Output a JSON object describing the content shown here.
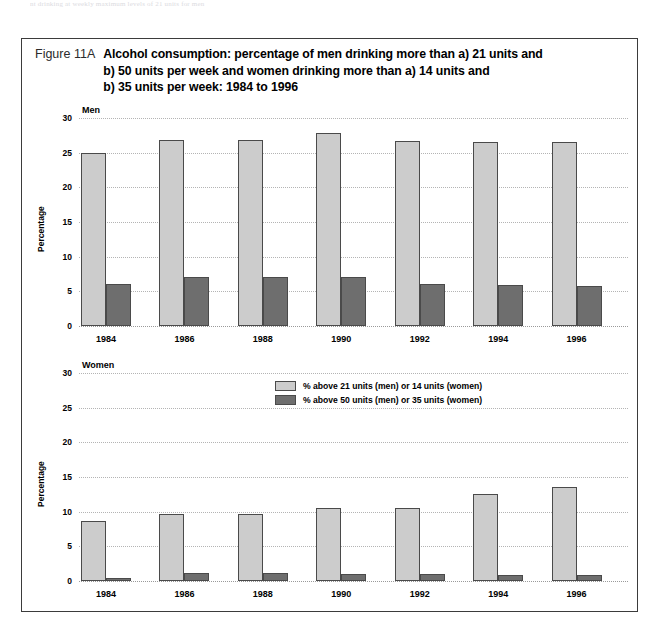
{
  "top_strip": {
    "text": "nt drinking at weekly maximum levels of 21 units for men"
  },
  "figure": {
    "number": "Figure 11A",
    "title_lines": [
      "Alcohol consumption: percentage of men drinking more than a) 21 units and",
      "b) 50 units per week and women drinking more than a) 14 units and",
      "b) 35 units per week: 1984 to 1996"
    ]
  },
  "colors": {
    "light_bar": "#cccccc",
    "dark_bar": "#6e6e6e",
    "bar_border": "#4a4a4a",
    "gridline": "#b4b4b4",
    "frame": "#3b3b3b"
  },
  "legend": {
    "items": [
      {
        "label": "% above 21 units (men) or 14 units (women)",
        "color": "#cccccc",
        "key": "legend-swatch-light"
      },
      {
        "label": "% above 50 units (men) or 35 units (women)",
        "color": "#6e6e6e",
        "key": "legend-swatch-dark"
      }
    ]
  },
  "chart_data": [
    {
      "type": "bar",
      "panel": "Men",
      "title": "Men",
      "xlabel": "",
      "ylabel": "Percentage",
      "ylim": [
        0,
        30
      ],
      "yticks": [
        0,
        5,
        10,
        15,
        20,
        25,
        30
      ],
      "ytick_labels": [
        "0",
        "5",
        "10",
        "15",
        "20",
        "25",
        "30"
      ],
      "grid": true,
      "categories": [
        "1984",
        "1986",
        "1988",
        "1990",
        "1992",
        "1994",
        "1996"
      ],
      "series": [
        {
          "name": "% above 21 units (men) or 14 units (women)",
          "color": "#cccccc",
          "values": [
            25.0,
            26.8,
            26.8,
            27.9,
            26.7,
            26.6,
            26.5
          ]
        },
        {
          "name": "% above 50 units (men) or 35 units (women)",
          "color": "#6e6e6e",
          "values": [
            6.1,
            7.1,
            7.1,
            7.0,
            6.0,
            5.9,
            5.8
          ]
        }
      ]
    },
    {
      "type": "bar",
      "panel": "Women",
      "title": "Women",
      "xlabel": "",
      "ylabel": "Percentage",
      "ylim": [
        0,
        30
      ],
      "yticks": [
        0,
        5,
        10,
        15,
        20,
        25,
        30
      ],
      "ytick_labels": [
        "0",
        "5",
        "10",
        "15",
        "20",
        "25",
        "30"
      ],
      "grid": true,
      "categories": [
        "1984",
        "1986",
        "1988",
        "1990",
        "1992",
        "1994",
        "1996"
      ],
      "series": [
        {
          "name": "% above 21 units (men) or 14 units (women)",
          "color": "#cccccc",
          "values": [
            8.7,
            9.7,
            9.7,
            10.6,
            10.5,
            12.6,
            13.5
          ]
        },
        {
          "name": "% above 50 units (men) or 35 units (women)",
          "color": "#6e6e6e",
          "values": [
            0.4,
            1.1,
            1.1,
            1.0,
            1.0,
            0.9,
            0.9
          ]
        }
      ]
    }
  ]
}
